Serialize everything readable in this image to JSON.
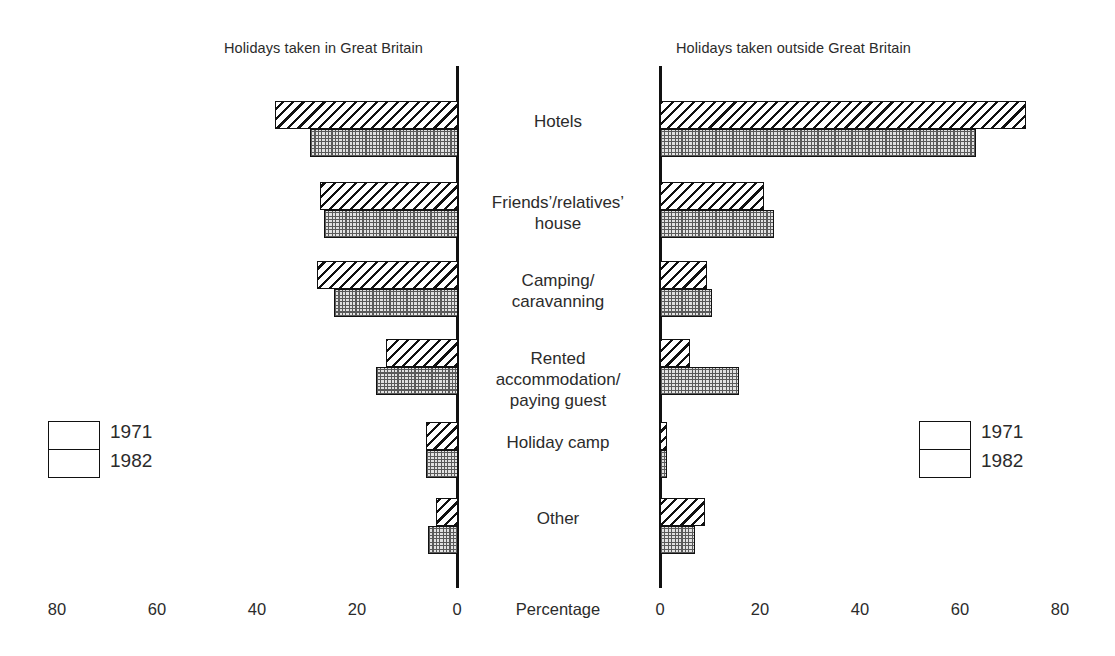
{
  "panels": {
    "left": {
      "title": "Holidays taken in Great Britain"
    },
    "right": {
      "title": "Holidays taken outside Great Britain"
    }
  },
  "axis": {
    "caption": "Percentage",
    "left_ticks": [
      "80",
      "60",
      "40",
      "20",
      "0"
    ],
    "right_ticks": [
      "0",
      "20",
      "40",
      "60",
      "80"
    ]
  },
  "legend_left": {
    "series": [
      "1971",
      "1982"
    ]
  },
  "legend_right": {
    "series": [
      "1971",
      "1982"
    ]
  },
  "categories": [
    {
      "line1": "Hotels",
      "line2": "",
      "line3": ""
    },
    {
      "line1": "Friends’/relatives’",
      "line2": "house",
      "line3": ""
    },
    {
      "line1": "Camping/",
      "line2": "caravanning",
      "line3": ""
    },
    {
      "line1": "Rented",
      "line2": "accommodation/",
      "line3": "paying guest"
    },
    {
      "line1": "Holiday camp",
      "line2": "",
      "line3": ""
    },
    {
      "line1": "Other",
      "line2": "",
      "line3": ""
    }
  ],
  "chart_data": {
    "type": "bar",
    "orientation": "horizontal",
    "layout": "back-to-back bidirectional (butterfly) bar chart, two panels sharing central category labels",
    "xlabel": "Percentage",
    "ylabel": "",
    "grid": false,
    "legend_position": "outer left and outer right, vertically centred",
    "xlim_left": [
      0,
      80
    ],
    "xlim_right": [
      0,
      80
    ],
    "xticks_left": [
      80,
      60,
      40,
      20,
      0
    ],
    "xticks_right": [
      0,
      20,
      40,
      60,
      80
    ],
    "categories": [
      "Hotels",
      "Friends'/relatives' house",
      "Camping/caravanning",
      "Rented accommodation/paying guest",
      "Holiday camp",
      "Other"
    ],
    "panels": [
      {
        "name": "Holidays taken in Great Britain",
        "direction": "left",
        "series": [
          {
            "name": "1971",
            "values": [
              37,
              28,
              28.5,
              14.5,
              6.5,
              4.5
            ]
          },
          {
            "name": "1982",
            "values": [
              30,
              27,
              25,
              16.5,
              6.5,
              6
            ]
          }
        ]
      },
      {
        "name": "Holidays taken outside Great Britain",
        "direction": "right",
        "series": [
          {
            "name": "1971",
            "values": [
              74,
              21,
              9.5,
              6,
              1.5,
              9
            ]
          },
          {
            "name": "1982",
            "values": [
              64,
              23,
              10.5,
              16,
              1.5,
              7
            ]
          }
        ]
      }
    ]
  }
}
